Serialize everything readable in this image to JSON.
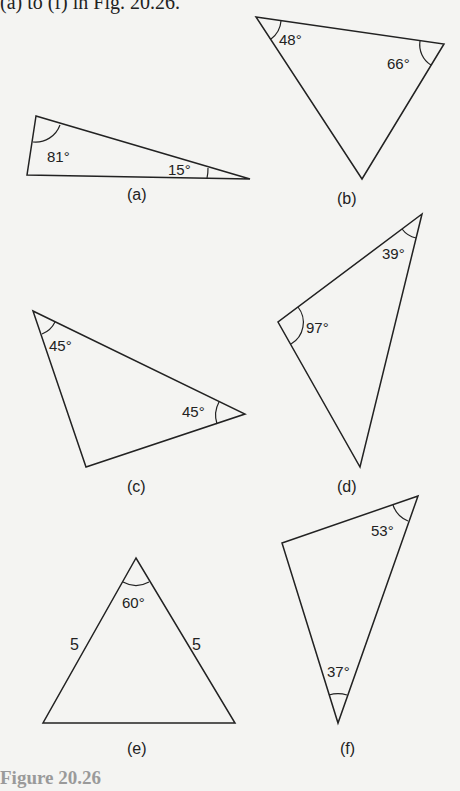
{
  "header": {
    "text": "(a) to (f) in Fig. 20.26."
  },
  "caption": "Figure 20.26",
  "triangles": [
    {
      "id": "a",
      "label": "(a)",
      "points": "36,116 27,175 250,179",
      "angles": [
        {
          "vertex": "top-left",
          "value": "81°",
          "x": 47,
          "y": 162
        },
        {
          "vertex": "right",
          "value": "15°",
          "x": 168,
          "y": 175
        }
      ],
      "label_pos": {
        "x": 140,
        "y": 200
      }
    },
    {
      "id": "b",
      "label": "(b)",
      "points": "256,17 444,44 362,179",
      "angles": [
        {
          "vertex": "top-left",
          "value": "48°",
          "x": 279,
          "y": 45
        },
        {
          "vertex": "top-right",
          "value": "66°",
          "x": 387,
          "y": 69
        }
      ],
      "label_pos": {
        "x": 350,
        "y": 204
      }
    },
    {
      "id": "c",
      "label": "(c)",
      "points": "33,311 245,414 86,467",
      "angles": [
        {
          "vertex": "top-left",
          "value": "45°",
          "x": 49,
          "y": 351
        },
        {
          "vertex": "right",
          "value": "45°",
          "x": 182,
          "y": 417
        }
      ],
      "label_pos": {
        "x": 140,
        "y": 492
      }
    },
    {
      "id": "d",
      "label": "(d)",
      "points": "422,214 278,322 360,467",
      "angles": [
        {
          "vertex": "top",
          "value": "39°",
          "x": 382,
          "y": 259
        },
        {
          "vertex": "left",
          "value": "97°",
          "x": 306,
          "y": 333
        }
      ],
      "label_pos": {
        "x": 350,
        "y": 492
      }
    },
    {
      "id": "e",
      "label": "(e)",
      "points": "136,558 43,723 235,723",
      "angles": [
        {
          "vertex": "apex",
          "value": "60°",
          "x": 122,
          "y": 608
        }
      ],
      "sides": [
        {
          "value": "5",
          "x": 70,
          "y": 650
        },
        {
          "value": "5",
          "x": 192,
          "y": 650
        }
      ],
      "label_pos": {
        "x": 140,
        "y": 754
      }
    },
    {
      "id": "f",
      "label": "(f)",
      "points": "418,496 282,543 338,723",
      "angles": [
        {
          "vertex": "top-right",
          "value": "53°",
          "x": 371,
          "y": 536
        },
        {
          "vertex": "bottom",
          "value": "37°",
          "x": 327,
          "y": 677
        }
      ],
      "label_pos": {
        "x": 350,
        "y": 754
      }
    }
  ]
}
